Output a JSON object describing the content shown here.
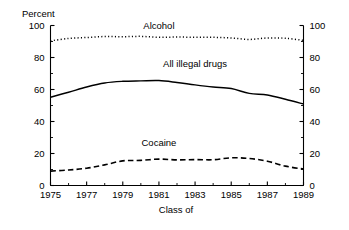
{
  "chart_data": {
    "type": "line",
    "title": "",
    "ylabel": "Percent",
    "xlabel": "Class of",
    "ylim": [
      0,
      100
    ],
    "xlim": [
      1975,
      1989
    ],
    "grid": false,
    "legend_position": "inline-annotations",
    "y_ticks": [
      "0",
      "20",
      "40",
      "60",
      "80",
      "100"
    ],
    "y_tick_values": [
      0,
      20,
      40,
      60,
      80,
      100
    ],
    "y_minor_tick_values": [
      10,
      30,
      50,
      70,
      90
    ],
    "y_axis_mirrored_right": true,
    "right_y_ticks": [
      "0",
      "20",
      "40",
      "60",
      "80",
      "100"
    ],
    "x_ticks": [
      "1975",
      "1977",
      "1979",
      "1981",
      "1983",
      "1985",
      "1987",
      "1989"
    ],
    "x_tick_values": [
      1975,
      1977,
      1979,
      1981,
      1983,
      1985,
      1987,
      1989
    ],
    "x_minor_tick_values": [
      1976,
      1978,
      1980,
      1982,
      1984,
      1986,
      1988
    ],
    "x": [
      1975,
      1976,
      1977,
      1978,
      1979,
      1980,
      1981,
      1982,
      1983,
      1984,
      1985,
      1986,
      1987,
      1988,
      1989
    ],
    "series": [
      {
        "name": "Alcohol",
        "style": "dotted",
        "color": "#000000",
        "label_x": 1981,
        "label_y": 98,
        "values": [
          90.4,
          91.9,
          92.5,
          93.1,
          93.0,
          93.2,
          92.6,
          92.8,
          92.6,
          92.6,
          92.2,
          91.3,
          92.2,
          92.0,
          90.7
        ]
      },
      {
        "name": "All illegal drugs",
        "style": "solid",
        "color": "#000000",
        "label_x": 1983,
        "label_y": 74,
        "values": [
          55.2,
          58.3,
          61.6,
          64.1,
          65.1,
          65.4,
          65.6,
          64.4,
          62.9,
          61.6,
          60.6,
          57.6,
          56.6,
          53.9,
          50.9
        ]
      },
      {
        "name": "Cocaine",
        "style": "dashed",
        "color": "#000000",
        "label_x": 1981,
        "label_y": 25,
        "values": [
          9.0,
          9.7,
          10.8,
          12.9,
          15.4,
          15.7,
          16.5,
          16.0,
          16.2,
          16.1,
          17.3,
          16.9,
          15.2,
          12.1,
          10.3
        ]
      }
    ]
  }
}
